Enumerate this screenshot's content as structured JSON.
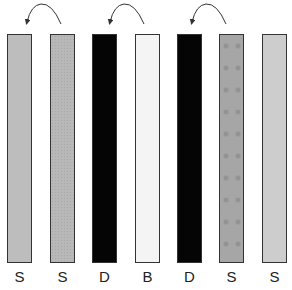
{
  "diagram": {
    "bars": [
      {
        "label": "S",
        "fill": "#bdbdbd",
        "texture": "plain",
        "x": 7
      },
      {
        "label": "S",
        "fill": "#b8b8b8",
        "texture": "dotted",
        "x": 50
      },
      {
        "label": "D",
        "fill": "#050505",
        "texture": "plain",
        "x": 92
      },
      {
        "label": "B",
        "fill": "#f4f4f4",
        "texture": "plain",
        "x": 135
      },
      {
        "label": "D",
        "fill": "#050505",
        "texture": "plain",
        "x": 177
      },
      {
        "label": "S",
        "fill": "#a6a6a6",
        "texture": "star-pattern",
        "x": 219
      },
      {
        "label": "S",
        "fill": "#cdcdcd",
        "texture": "plain",
        "x": 262
      }
    ],
    "arrows": [
      {
        "from_bar": 2,
        "to_bar": 1,
        "direction": "counter-clockwise arc, right to left"
      },
      {
        "from_bar": 4,
        "to_bar": 3,
        "direction": "counter-clockwise arc, right to left"
      },
      {
        "from_bar": 6,
        "to_bar": 5,
        "direction": "counter-clockwise arc, right to left"
      }
    ],
    "colors": {
      "border": "#333333",
      "arrow": "#333333",
      "label": "#222222"
    }
  }
}
